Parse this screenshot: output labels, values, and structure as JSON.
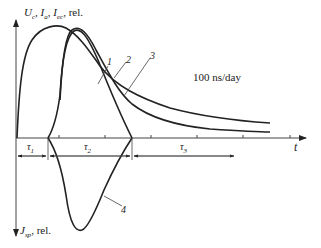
{
  "diagram": {
    "y_axis_top_label": "U꜀, I꜀, Iₑ꜀, rel.",
    "y_axis_top_label_parts": {
      "u": "U",
      "u_sub": "c",
      "i1": "I",
      "i1_sub": "a",
      "i2": "I",
      "i2_sub": "ec",
      "suffix": "rel."
    },
    "y_axis_bottom_label_parts": {
      "j": "J",
      "j_sub": "sp",
      "suffix": "rel."
    },
    "x_axis_label": "t",
    "annotation": "100 ns/day",
    "curve_labels": [
      "1",
      "2",
      "3",
      "4"
    ],
    "intervals": [
      "τ1",
      "τ2",
      "τ3"
    ],
    "interval_parts": [
      {
        "sym": "τ",
        "sub": "1"
      },
      {
        "sym": "τ",
        "sub": "2"
      },
      {
        "sym": "τ",
        "sub": "3"
      }
    ],
    "stroke_color": "#222222"
  }
}
